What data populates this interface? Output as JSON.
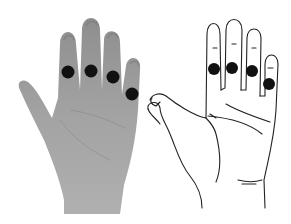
{
  "figure": {
    "background": "#ffffff",
    "dot_color": "#111111",
    "photo_hand": {
      "skin_fill": "#9a9a9a",
      "markers": [
        {
          "finger": "index",
          "cx": 68,
          "cy": 72,
          "r": 6.5
        },
        {
          "finger": "middle",
          "cx": 91,
          "cy": 71,
          "r": 6.5
        },
        {
          "finger": "ring",
          "cx": 113,
          "cy": 77,
          "r": 6.5
        },
        {
          "finger": "little",
          "cx": 132,
          "cy": 94,
          "r": 6.5
        }
      ]
    },
    "drawing_hand": {
      "stroke": "#222222",
      "markers": [
        {
          "finger": "index",
          "cx": 214,
          "cy": 69,
          "r": 6
        },
        {
          "finger": "middle",
          "cx": 232,
          "cy": 68,
          "r": 6
        },
        {
          "finger": "ring",
          "cx": 252,
          "cy": 71,
          "r": 6
        },
        {
          "finger": "little",
          "cx": 269,
          "cy": 84,
          "r": 6
        }
      ]
    }
  }
}
